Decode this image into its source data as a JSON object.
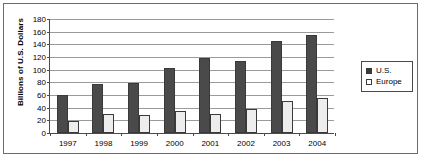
{
  "chart_data": {
    "type": "bar",
    "title": "",
    "xlabel": "",
    "ylabel": "Billions of U.S. Dollars",
    "categories": [
      "1997",
      "1998",
      "1999",
      "2000",
      "2001",
      "2002",
      "2003",
      "2004"
    ],
    "series": [
      {
        "name": "U.S.",
        "color": "#4a4a4a",
        "values": [
          60,
          78,
          79,
          103,
          118,
          113,
          145,
          155
        ]
      },
      {
        "name": "Europe",
        "color": "#ededed",
        "values": [
          19,
          30,
          28,
          34,
          30,
          38,
          51,
          56
        ]
      }
    ],
    "ylim": [
      0,
      180
    ],
    "ytick_values": [
      0,
      20,
      40,
      60,
      80,
      100,
      120,
      140,
      160,
      180
    ],
    "ytick_labels": [
      "0",
      "20",
      "40",
      "60",
      "80",
      "100",
      "120",
      "140",
      "160",
      "180"
    ],
    "grid": true,
    "legend_position": "right"
  },
  "legend": {
    "entries": [
      {
        "label": "U.S.",
        "swatch": "filled-square"
      },
      {
        "label": "Europe",
        "swatch": "empty-square"
      }
    ]
  }
}
